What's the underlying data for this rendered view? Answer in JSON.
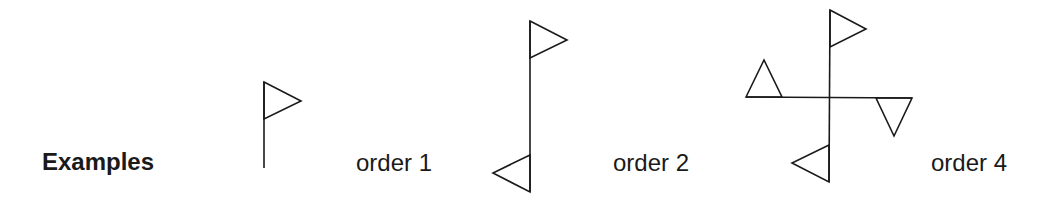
{
  "title": "Examples",
  "examples": [
    {
      "label": "order 1",
      "flags": 1
    },
    {
      "label": "order 2",
      "flags": 2
    },
    {
      "label": "order 4",
      "flags": 4
    }
  ],
  "colors": {
    "stroke": "#1a1a1a",
    "background": "#ffffff"
  }
}
